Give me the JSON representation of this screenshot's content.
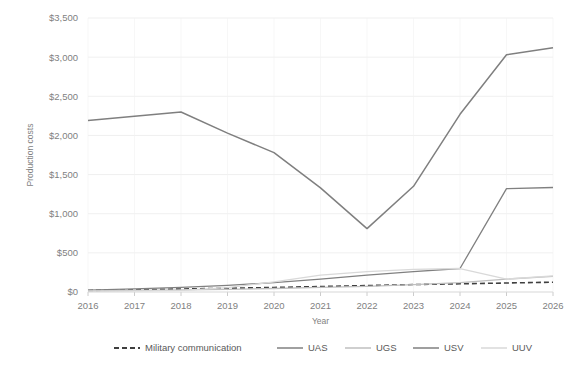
{
  "chart_data": {
    "type": "line",
    "title": "",
    "xlabel": "Year",
    "ylabel": "Production costs",
    "x": [
      2016,
      2017,
      2018,
      2019,
      2020,
      2021,
      2022,
      2023,
      2024,
      2025,
      2026
    ],
    "categories": [
      "2016",
      "2017",
      "2018",
      "2019",
      "2020",
      "2021",
      "2022",
      "2023",
      "2024",
      "2025",
      "2026"
    ],
    "ylim": [
      0,
      3500
    ],
    "yticks": [
      0,
      500,
      1000,
      1500,
      2000,
      2500,
      3000,
      3500
    ],
    "ytick_labels": [
      "$0",
      "$500",
      "$1,000",
      "$1,500",
      "$2,000",
      "$2,500",
      "$3,000",
      "$3,500"
    ],
    "grid": true,
    "legend_position": "bottom",
    "series": [
      {
        "name": "Military communication",
        "style": "dashed",
        "color": "#3f3f3f",
        "values": [
          20,
          28,
          38,
          48,
          58,
          70,
          82,
          95,
          105,
          115,
          125
        ]
      },
      {
        "name": "UAS",
        "style": "solid",
        "color": "#808080",
        "values": [
          25,
          40,
          60,
          85,
          120,
          165,
          215,
          260,
          300,
          1320,
          1335
        ]
      },
      {
        "name": "UGS",
        "style": "solid",
        "color": "#bfbfbf",
        "values": [
          15,
          20,
          26,
          34,
          45,
          58,
          72,
          95,
          120,
          165,
          200
        ]
      },
      {
        "name": "USV",
        "style": "solid",
        "color": "#7f7f7f",
        "values": [
          2190,
          2245,
          2300,
          2030,
          1780,
          1330,
          810,
          1350,
          2270,
          3030,
          3120
        ]
      },
      {
        "name": "UUV",
        "style": "solid",
        "color": "#d9d9d9",
        "values": [
          10,
          14,
          20,
          55,
          130,
          215,
          260,
          290,
          300,
          165,
          205
        ]
      }
    ]
  },
  "legend": {
    "items": [
      {
        "label": "Military communication"
      },
      {
        "label": "UAS"
      },
      {
        "label": "UGS"
      },
      {
        "label": "USV"
      },
      {
        "label": "UUV"
      }
    ]
  },
  "colors": {
    "gridline": "#e8e8e8",
    "axis": "#d9d9d9",
    "text": "#7f7f7f",
    "background": "#ffffff"
  }
}
